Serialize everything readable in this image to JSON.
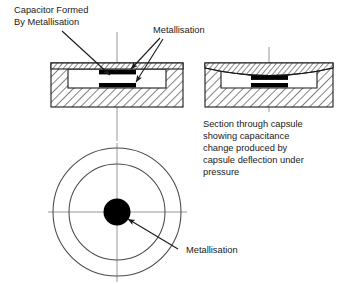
{
  "figure": {
    "background_color": "#ffffff",
    "ink_color": "#1a1a1a",
    "plate_color": "#000000"
  },
  "labels": {
    "capacitor_formed": {
      "name": "capacitor-formed-by-metallisation-label",
      "lines": [
        "Capacitor Formed",
        "By Metallisation"
      ]
    },
    "metallisation_top": {
      "name": "metallisation-label-top",
      "lines": [
        "Metallisation"
      ]
    },
    "section_caption": {
      "name": "section-through-capsule-caption",
      "lines": [
        "Section through capsule",
        "showing capacitance",
        "change produced by",
        "capsule deflection under",
        "pressure"
      ]
    },
    "metallisation_plan": {
      "name": "metallisation-label-plan",
      "lines": [
        "Metallisation"
      ]
    }
  },
  "views": {
    "undeflected_section": {
      "name": "undeflected-capsule-section",
      "caption": "",
      "diaphragm": "flat",
      "plates": [
        "upper-metallisation-plate",
        "lower-metallisation-plate"
      ]
    },
    "deflected_section": {
      "name": "deflected-capsule-section",
      "diaphragm": "deflected-downward",
      "plates": [
        "upper-metallisation-plate",
        "lower-metallisation-plate"
      ]
    },
    "plan_view": {
      "name": "capsule-plan-view",
      "circle_count": 3,
      "center_disc": "metallisation-disc",
      "centre_lines": [
        "horizontal-centre-line",
        "vertical-centre-line"
      ]
    }
  }
}
